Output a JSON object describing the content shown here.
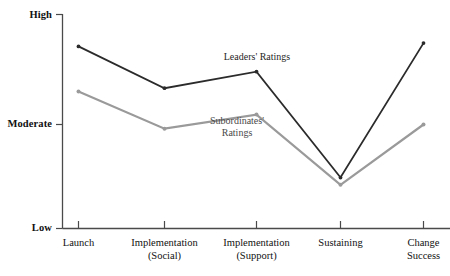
{
  "chart_data": {
    "type": "line",
    "title": "",
    "subtitle": "",
    "xlabel": "",
    "ylabel": "",
    "grid": false,
    "legend_position": "inline-annotations",
    "categories": [
      "Launch",
      "Implementation (Social)",
      "Implementation (Support)",
      "Sustaining",
      "Change Success"
    ],
    "category_lines": [
      [
        "Launch"
      ],
      [
        "Implementation",
        "(Social)"
      ],
      [
        "Implementation",
        "(Support)"
      ],
      [
        "Sustaining"
      ],
      [
        "Change",
        "Success"
      ]
    ],
    "y_tick_labels": [
      "High",
      "Moderate",
      "Low"
    ],
    "y_tick_values": [
      3.0,
      2.0,
      1.0
    ],
    "ylim": [
      1.0,
      3.0
    ],
    "series": [
      {
        "name": "Leaders' Ratings",
        "color": "#2b2b2b",
        "values": [
          2.71,
          2.33,
          2.48,
          1.49,
          2.74
        ]
      },
      {
        "name": "Subordinates' Ratings",
        "color": "#9a9a9a",
        "values": [
          2.3,
          1.96,
          2.09,
          1.42,
          2.0
        ]
      }
    ],
    "annotations": [
      {
        "id": "leaders-annotation",
        "lines": [
          "Leaders' Ratings"
        ],
        "x": 257,
        "y": 58,
        "color": "#1f1f1f"
      },
      {
        "id": "subordinates-annotation",
        "lines": [
          "Subordinates'",
          "Ratings"
        ],
        "x": 237,
        "y": 129,
        "color": "#4a4a4a"
      }
    ]
  },
  "axes": {
    "y_axis_label_high": "High",
    "y_axis_label_moderate": "Moderate",
    "y_axis_label_low": "Low",
    "x_labels": {
      "launch_l1": "Launch",
      "impl_social_l1": "Implementation",
      "impl_social_l2": "(Social)",
      "impl_support_l1": "Implementation",
      "impl_support_l2": "(Support)",
      "sustaining_l1": "Sustaining",
      "change_success_l1": "Change",
      "change_success_l2": "Success"
    }
  },
  "annotations": {
    "leaders_line1": "Leaders' Ratings",
    "subordinates_line1": "Subordinates'",
    "subordinates_line2": "Ratings"
  },
  "colors": {
    "leaders": "#2b2b2b",
    "subordinates": "#9a9a9a",
    "axis": "#4a4a4a",
    "background": "#ffffff"
  }
}
